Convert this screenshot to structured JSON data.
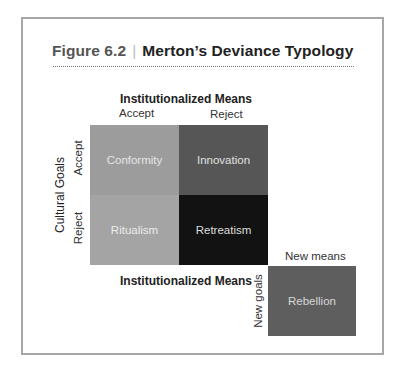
{
  "figure": {
    "number": "Figure 6.2",
    "separator": "|",
    "title": "Merton’s Deviance Typology"
  },
  "axes": {
    "top_label": "Institutionalized Means",
    "top_options": [
      "Accept",
      "Reject"
    ],
    "left_label": "Cultural Goals",
    "left_options": [
      "Accept",
      "Reject"
    ],
    "bottom_label": "Institutionalized Means"
  },
  "cells": [
    {
      "label": "Conformity",
      "means": "Accept",
      "goals": "Accept",
      "color": "#9c9c9c",
      "text_color": "#e6e6e6"
    },
    {
      "label": "Innovation",
      "means": "Reject",
      "goals": "Accept",
      "color": "#565656",
      "text_color": "#e0e0e0"
    },
    {
      "label": "Ritualism",
      "means": "Accept",
      "goals": "Reject",
      "color": "#a4a4a4",
      "text_color": "#ececec"
    },
    {
      "label": "Retreatism",
      "means": "Reject",
      "goals": "Reject",
      "color": "#121212",
      "text_color": "#dedede"
    }
  ],
  "rebellion": {
    "top_label": "New means",
    "side_label": "New goals",
    "label": "Rebellion",
    "color": "#5e5e5e",
    "text_color": "#d8d8d8"
  }
}
